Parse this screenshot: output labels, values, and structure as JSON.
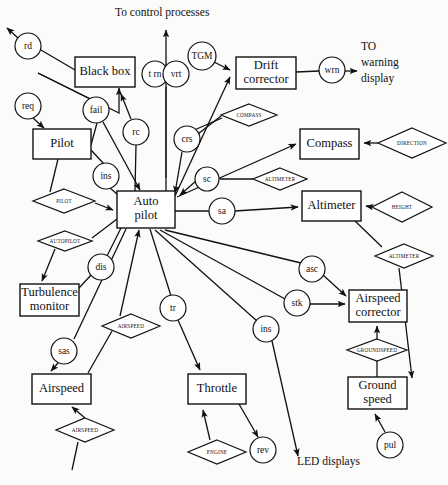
{
  "diagram": {
    "type": "data-flow-diagram",
    "colors": {
      "stroke": "#111111",
      "fill": "#ffffff",
      "background": "#fbfbf9"
    }
  },
  "free_labels": [
    {
      "id": "to-control-processes",
      "text": "To control processes",
      "x": 115,
      "y": 16
    },
    {
      "id": "to-warning-1",
      "text": "TO",
      "x": 361,
      "y": 50
    },
    {
      "id": "to-warning-2",
      "text": "warning",
      "x": 361,
      "y": 66
    },
    {
      "id": "to-warning-3",
      "text": "display",
      "x": 361,
      "y": 82
    },
    {
      "id": "led-displays",
      "text": "LED displays",
      "x": 297,
      "y": 465
    }
  ],
  "boxes": [
    {
      "id": "black-box",
      "label": "Black box",
      "lines": [
        "Black box"
      ],
      "x": 75,
      "y": 57,
      "w": 60,
      "h": 30
    },
    {
      "id": "drift-corrector",
      "label": "Drift corrector",
      "lines": [
        "Drift",
        "corrector"
      ],
      "x": 236,
      "y": 57,
      "w": 60,
      "h": 32
    },
    {
      "id": "pilot",
      "label": "Pilot",
      "lines": [
        "Pilot"
      ],
      "x": 33,
      "y": 129,
      "w": 58,
      "h": 30
    },
    {
      "id": "compass",
      "label": "Compass",
      "lines": [
        "Compass"
      ],
      "x": 300,
      "y": 129,
      "w": 59,
      "h": 30
    },
    {
      "id": "auto-pilot",
      "label": "Auto pilot",
      "lines": [
        "Auto",
        "pilot"
      ],
      "x": 117,
      "y": 191,
      "w": 58,
      "h": 37
    },
    {
      "id": "altimeter",
      "label": "Altimeter",
      "lines": [
        "Altimeter"
      ],
      "x": 302,
      "y": 191,
      "w": 59,
      "h": 30
    },
    {
      "id": "turbulence-monitor",
      "label": "Turbulence monitor",
      "lines": [
        "Turbulence",
        "monitor"
      ],
      "x": 20,
      "y": 284,
      "w": 59,
      "h": 32
    },
    {
      "id": "airspeed-corrector",
      "label": "Airspeed corrector",
      "lines": [
        "Airspeed",
        "corrector"
      ],
      "x": 349,
      "y": 290,
      "w": 58,
      "h": 32
    },
    {
      "id": "airspeed",
      "label": "Airspeed",
      "lines": [
        "Airspeed"
      ],
      "x": 32,
      "y": 374,
      "w": 59,
      "h": 30
    },
    {
      "id": "throttle",
      "label": "Throttle",
      "lines": [
        "Throttle"
      ],
      "x": 188,
      "y": 374,
      "w": 58,
      "h": 30
    },
    {
      "id": "ground-speed",
      "label": "Ground speed",
      "lines": [
        "Ground",
        "speed"
      ],
      "x": 348,
      "y": 377,
      "w": 59,
      "h": 32
    }
  ],
  "circles": [
    {
      "id": "rd",
      "label": "rd",
      "cx": 28,
      "cy": 46,
      "r": 13
    },
    {
      "id": "trn",
      "label": "t rn",
      "cx": 155,
      "cy": 74,
      "r": 13
    },
    {
      "id": "vrt",
      "label": "vrt",
      "cx": 176,
      "cy": 74,
      "r": 13
    },
    {
      "id": "tgm",
      "label": "TGM",
      "cx": 202,
      "cy": 56,
      "r": 14
    },
    {
      "id": "wrn",
      "label": "wrn",
      "cx": 332,
      "cy": 70,
      "r": 13
    },
    {
      "id": "req",
      "label": "req",
      "cx": 28,
      "cy": 106,
      "r": 13
    },
    {
      "id": "fail",
      "label": "fail",
      "cx": 96,
      "cy": 110,
      "r": 13
    },
    {
      "id": "rc",
      "label": "rc",
      "cx": 136,
      "cy": 132,
      "r": 13
    },
    {
      "id": "crs",
      "label": "crs",
      "cx": 187,
      "cy": 139,
      "r": 13
    },
    {
      "id": "sc",
      "label": "sc",
      "cx": 207,
      "cy": 179,
      "r": 12
    },
    {
      "id": "ins1",
      "label": "ins",
      "cx": 106,
      "cy": 176,
      "r": 13
    },
    {
      "id": "sa",
      "label": "sa",
      "cx": 222,
      "cy": 211,
      "r": 13
    },
    {
      "id": "dis",
      "label": "dis",
      "cx": 101,
      "cy": 267,
      "r": 13
    },
    {
      "id": "asc",
      "label": "asc",
      "cx": 312,
      "cy": 269,
      "r": 13
    },
    {
      "id": "stk",
      "label": "stk",
      "cx": 297,
      "cy": 303,
      "r": 13
    },
    {
      "id": "tr",
      "label": "tr",
      "cx": 173,
      "cy": 308,
      "r": 13
    },
    {
      "id": "ins2",
      "label": "ins",
      "cx": 266,
      "cy": 329,
      "r": 13
    },
    {
      "id": "sas",
      "label": "sas",
      "cx": 64,
      "cy": 351,
      "r": 13
    },
    {
      "id": "rev",
      "label": "rev",
      "cx": 263,
      "cy": 450,
      "r": 13
    },
    {
      "id": "pul",
      "label": "pul",
      "cx": 390,
      "cy": 445,
      "r": 13
    }
  ],
  "diamonds": [
    {
      "id": "compass-store",
      "label": "COMPASS",
      "cx": 249,
      "cy": 115,
      "rx": 28,
      "ry": 11
    },
    {
      "id": "direction-store",
      "label": "DIRECTION",
      "cx": 412,
      "cy": 143,
      "rx": 34,
      "ry": 15
    },
    {
      "id": "altimeter-store-1",
      "label": "ALTIMETER",
      "cx": 280,
      "cy": 179,
      "rx": 27,
      "ry": 11
    },
    {
      "id": "pilot-store",
      "label": "PILOT",
      "cx": 64,
      "cy": 201,
      "rx": 31,
      "ry": 12
    },
    {
      "id": "height-store",
      "label": "HEIGHT",
      "cx": 402,
      "cy": 207,
      "rx": 30,
      "ry": 15
    },
    {
      "id": "autopilot-store",
      "label": "AUTOPILOT",
      "cx": 65,
      "cy": 241,
      "rx": 27,
      "ry": 10
    },
    {
      "id": "altimeter-store-2",
      "label": "ALTIMETER",
      "cx": 404,
      "cy": 256,
      "rx": 29,
      "ry": 12
    },
    {
      "id": "airspeed-store-1",
      "label": "AIRSPEED",
      "cx": 131,
      "cy": 326,
      "rx": 29,
      "ry": 12
    },
    {
      "id": "groundspeed-store",
      "label": "GROUNDSPEED",
      "cx": 377,
      "cy": 350,
      "rx": 30,
      "ry": 11
    },
    {
      "id": "airspeed-store-2",
      "label": "AIRSPEED",
      "cx": 85,
      "cy": 430,
      "rx": 29,
      "ry": 12
    },
    {
      "id": "engine-store",
      "label": "ENGINE",
      "cx": 217,
      "cy": 452,
      "rx": 29,
      "ry": 12
    }
  ],
  "edges": [
    {
      "id": "rd-out",
      "from": "rd",
      "to": "external-up-left",
      "arrow": true
    },
    {
      "id": "blackbox-rd",
      "from": "black-box",
      "to": "rd",
      "arrow": false
    },
    {
      "id": "fail-blackbox",
      "from": "fail",
      "to": "black-box-diag",
      "arrow": true
    },
    {
      "id": "req-pilot",
      "from": "req",
      "to": "pilot",
      "arrow": true
    },
    {
      "id": "pilot-fail",
      "from": "pilot",
      "to": "fail",
      "arrow": false
    },
    {
      "id": "pilot-ins",
      "from": "pilot",
      "to": "ins1",
      "arrow": false
    },
    {
      "id": "ins-autopilot",
      "from": "ins1",
      "to": "auto-pilot",
      "arrow": true
    },
    {
      "id": "fail-autopilot",
      "from": "fail",
      "to": "auto-pilot",
      "arrow": true
    },
    {
      "id": "rc-blackbox",
      "from": "rc",
      "to": "black-box",
      "arrow": true
    },
    {
      "id": "autopilot-rc",
      "from": "auto-pilot",
      "to": "rc",
      "arrow": false
    },
    {
      "id": "autopilot-control",
      "from": "auto-pilot",
      "to": "to-control-processes",
      "arrow": true
    },
    {
      "id": "trn-vrt-autopilot",
      "from": "trn-vrt",
      "to": "auto-pilot",
      "arrow": true
    },
    {
      "id": "tgm-drift",
      "from": "tgm",
      "to": "drift-corrector",
      "arrow": true
    },
    {
      "id": "autopilot-drift",
      "from": "auto-pilot",
      "to": "drift-corrector",
      "arrow": true
    },
    {
      "id": "drift-wrn",
      "from": "drift-corrector",
      "to": "wrn",
      "arrow": false
    },
    {
      "id": "wrn-warning",
      "from": "wrn",
      "to": "to-warning-display",
      "arrow": true
    },
    {
      "id": "crs-autopilot",
      "from": "crs",
      "to": "auto-pilot",
      "arrow": true
    },
    {
      "id": "compass-store-link",
      "from": "compass-store",
      "to": "crs-line",
      "arrow": false
    },
    {
      "id": "autopilot-compass",
      "from": "auto-pilot",
      "to": "compass",
      "arrow": true
    },
    {
      "id": "direction-compass",
      "from": "direction-store",
      "to": "compass",
      "arrow": true
    },
    {
      "id": "sc-autopilot",
      "from": "sc",
      "to": "auto-pilot",
      "arrow": true
    },
    {
      "id": "altimeter-sc",
      "from": "altimeter-store-1",
      "to": "sc",
      "arrow": false
    },
    {
      "id": "sa-altimeter",
      "from": "sa",
      "to": "altimeter",
      "arrow": true
    },
    {
      "id": "autopilot-sa",
      "from": "auto-pilot",
      "to": "sa",
      "arrow": false
    },
    {
      "id": "height-altimeter",
      "from": "height-store",
      "to": "altimeter",
      "arrow": true
    },
    {
      "id": "pilot-store-autopilot",
      "from": "pilot-store",
      "to": "auto-pilot",
      "arrow": true
    },
    {
      "id": "autopilot-store-turb",
      "from": "autopilot-store",
      "to": "turbulence-monitor",
      "arrow": true
    },
    {
      "id": "dis-turbulence",
      "from": "dis",
      "to": "turbulence-monitor",
      "arrow": false
    },
    {
      "id": "autopilot-dis",
      "from": "auto-pilot",
      "to": "dis",
      "arrow": false
    },
    {
      "id": "sas-airspeed",
      "from": "sas",
      "to": "airspeed",
      "arrow": true
    },
    {
      "id": "autopilot-sas",
      "from": "auto-pilot",
      "to": "sas",
      "arrow": false
    },
    {
      "id": "airspeed-autopilot",
      "from": "airspeed-store-1",
      "to": "auto-pilot",
      "arrow": true
    },
    {
      "id": "airspeed-store-box",
      "from": "airspeed-store-2",
      "to": "airspeed",
      "arrow": true
    },
    {
      "id": "tr-throttle",
      "from": "tr",
      "to": "throttle",
      "arrow": true
    },
    {
      "id": "autopilot-tr",
      "from": "auto-pilot",
      "to": "tr",
      "arrow": false
    },
    {
      "id": "engine-throttle",
      "from": "engine-store",
      "to": "throttle",
      "arrow": true
    },
    {
      "id": "throttle-rev",
      "from": "throttle",
      "to": "rev",
      "arrow": true
    },
    {
      "id": "asc-corrector",
      "from": "asc",
      "to": "airspeed-corrector",
      "arrow": true
    },
    {
      "id": "stk-corrector",
      "from": "stk",
      "to": "airspeed-corrector",
      "arrow": true
    },
    {
      "id": "autopilot-asc",
      "from": "auto-pilot",
      "to": "asc",
      "arrow": false
    },
    {
      "id": "autopilot-stk",
      "from": "auto-pilot",
      "to": "stk",
      "arrow": false
    },
    {
      "id": "ins2-led",
      "from": "ins2",
      "to": "led-displays",
      "arrow": true
    },
    {
      "id": "autopilot-ins2",
      "from": "auto-pilot",
      "to": "ins2",
      "arrow": false
    },
    {
      "id": "groundspeed-corrector",
      "from": "groundspeed-store",
      "to": "airspeed-corrector",
      "arrow": true
    },
    {
      "id": "groundspeed-ground",
      "from": "ground-speed",
      "to": "groundspeed-store",
      "arrow": false
    },
    {
      "id": "pul-ground",
      "from": "pul",
      "to": "ground-speed",
      "arrow": true
    },
    {
      "id": "altimeter2-ground",
      "from": "altimeter-store-2",
      "to": "ground-speed",
      "arrow": true
    }
  ]
}
